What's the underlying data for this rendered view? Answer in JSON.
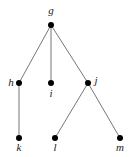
{
  "diagram": {
    "type": "rooted-tree",
    "nodes": [
      {
        "id": "g",
        "label": "g",
        "x": 51,
        "y": 25,
        "label_x": 51,
        "label_y": 14,
        "anchor": "middle"
      },
      {
        "id": "h",
        "label": "h",
        "x": 19,
        "y": 83,
        "label_x": 11,
        "label_y": 86,
        "anchor": "middle"
      },
      {
        "id": "i",
        "label": "i",
        "x": 51,
        "y": 83,
        "label_x": 51,
        "label_y": 97,
        "anchor": "middle"
      },
      {
        "id": "j",
        "label": "j",
        "x": 88,
        "y": 83,
        "label_x": 96,
        "label_y": 84,
        "anchor": "middle"
      },
      {
        "id": "k",
        "label": "k",
        "x": 19,
        "y": 138,
        "label_x": 19,
        "label_y": 151,
        "anchor": "middle"
      },
      {
        "id": "l",
        "label": "l",
        "x": 55,
        "y": 138,
        "label_x": 55,
        "label_y": 151,
        "anchor": "middle"
      },
      {
        "id": "m",
        "label": "m",
        "x": 120,
        "y": 138,
        "label_x": 120,
        "label_y": 151,
        "anchor": "middle"
      }
    ],
    "edges": [
      {
        "from": "g",
        "to": "h"
      },
      {
        "from": "g",
        "to": "i"
      },
      {
        "from": "g",
        "to": "j"
      },
      {
        "from": "h",
        "to": "k"
      },
      {
        "from": "j",
        "to": "l"
      },
      {
        "from": "j",
        "to": "m"
      }
    ],
    "colors": {
      "edge": "#777777",
      "node": "#000000",
      "label": "#222222",
      "background": "#ffffff"
    }
  }
}
